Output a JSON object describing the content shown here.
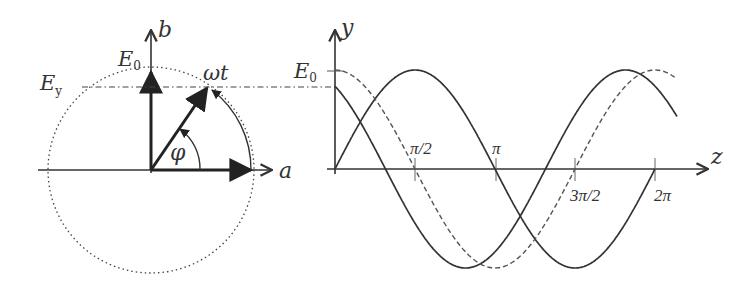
{
  "phasor_diagram": {
    "horizontal_axis_label": "a",
    "vertical_axis_label": "b",
    "amplitude_label": "E",
    "amplitude_subscript": "0",
    "projection_label": "E",
    "projection_subscript": "y",
    "rotating_phasor_label": "ωt",
    "angle_label": "φ"
  },
  "wave_plot": {
    "vertical_axis_label": "y",
    "horizontal_axis_label": "z",
    "amplitude_label": "E",
    "amplitude_subscript": "0",
    "ticks": [
      "π/2",
      "π",
      "3π/2",
      "2π"
    ]
  },
  "colors": {
    "stroke": "#333333",
    "dashed": "#555555",
    "background": "#ffffff"
  }
}
